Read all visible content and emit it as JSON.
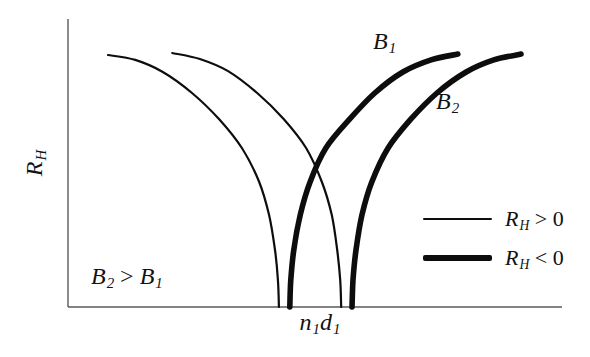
{
  "figure": {
    "background": "#ffffff",
    "text_color": "#121212",
    "axis_color": "#5a5a5a",
    "curve_color": "#0d0d0d"
  },
  "labels": {
    "y_axis": [
      {
        "t": "R"
      },
      {
        "t": "H",
        "sub": true
      }
    ],
    "x_tick": [
      {
        "t": "n"
      },
      {
        "t": "1",
        "sub": true
      },
      {
        "t": "d"
      },
      {
        "t": "1",
        "sub": true
      }
    ],
    "curve_b1": [
      {
        "t": "B"
      },
      {
        "t": "1",
        "sub": true
      }
    ],
    "curve_b2": [
      {
        "t": "B"
      },
      {
        "t": "2",
        "sub": true
      }
    ],
    "condition": [
      {
        "t": "B"
      },
      {
        "t": "2",
        "sub": true
      },
      {
        "t": " > ",
        "up": true
      },
      {
        "t": "B"
      },
      {
        "t": "1",
        "sub": true
      }
    ]
  },
  "legend": {
    "items": [
      {
        "style": "thin",
        "label": [
          {
            "t": "R"
          },
          {
            "t": "H",
            "sub": true
          },
          {
            "t": " > 0",
            "up": true
          }
        ]
      },
      {
        "style": "thick",
        "label": [
          {
            "t": "R"
          },
          {
            "t": "H",
            "sub": true
          },
          {
            "t": " < 0",
            "up": true
          }
        ]
      }
    ]
  },
  "chart_data": {
    "type": "line",
    "title": "",
    "ylabel": "R_H",
    "xlabel": "",
    "x_tick_label": "n1d1",
    "grid": false,
    "legend_position": "lower-right",
    "legend_entries": [
      "R_H > 0 (thin line)",
      "R_H < 0 (thick line)"
    ],
    "annotations": [
      "B2 > B1"
    ],
    "curve_labels": [
      "B1",
      "B2"
    ],
    "axes": {
      "x_normalized_range": [
        0,
        1
      ],
      "y_normalized_range": [
        0,
        1
      ],
      "numeric_ticks": false
    },
    "line_widths": {
      "thin": 2.2,
      "thick": 5.6
    },
    "series": [
      {
        "name": "B1-positive-branch",
        "style": "thin",
        "points": [
          [
            0.081,
            0.875
          ],
          [
            0.136,
            0.858
          ],
          [
            0.192,
            0.816
          ],
          [
            0.251,
            0.743
          ],
          [
            0.306,
            0.652
          ],
          [
            0.352,
            0.552
          ],
          [
            0.387,
            0.434
          ],
          [
            0.407,
            0.319
          ],
          [
            0.419,
            0.198
          ],
          [
            0.425,
            0.094
          ],
          [
            0.427,
            0.0
          ]
        ]
      },
      {
        "name": "B2-positive-branch",
        "style": "thin",
        "points": [
          [
            0.211,
            0.882
          ],
          [
            0.267,
            0.861
          ],
          [
            0.324,
            0.819
          ],
          [
            0.383,
            0.743
          ],
          [
            0.437,
            0.652
          ],
          [
            0.482,
            0.552
          ],
          [
            0.514,
            0.434
          ],
          [
            0.534,
            0.319
          ],
          [
            0.545,
            0.198
          ],
          [
            0.551,
            0.094
          ],
          [
            0.553,
            0.0
          ]
        ]
      },
      {
        "name": "B1-negative-branch",
        "style": "thick",
        "points": [
          [
            0.449,
            0.0
          ],
          [
            0.451,
            0.094
          ],
          [
            0.457,
            0.198
          ],
          [
            0.47,
            0.319
          ],
          [
            0.49,
            0.434
          ],
          [
            0.522,
            0.552
          ],
          [
            0.57,
            0.652
          ],
          [
            0.621,
            0.743
          ],
          [
            0.678,
            0.816
          ],
          [
            0.735,
            0.858
          ],
          [
            0.789,
            0.878
          ]
        ]
      },
      {
        "name": "B2-negative-branch",
        "style": "thick",
        "points": [
          [
            0.575,
            0.0
          ],
          [
            0.577,
            0.094
          ],
          [
            0.583,
            0.198
          ],
          [
            0.595,
            0.319
          ],
          [
            0.615,
            0.434
          ],
          [
            0.648,
            0.552
          ],
          [
            0.694,
            0.652
          ],
          [
            0.747,
            0.743
          ],
          [
            0.806,
            0.816
          ],
          [
            0.862,
            0.858
          ],
          [
            0.917,
            0.878
          ]
        ]
      }
    ]
  }
}
